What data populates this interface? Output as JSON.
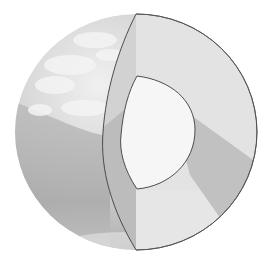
{
  "diagram": {
    "layers": [
      {
        "name": "crust-surface",
        "label": ""
      },
      {
        "name": "mantle",
        "label": ""
      },
      {
        "name": "core",
        "label": ""
      }
    ],
    "colors": {
      "background": "#ffffff",
      "globe_light": "#e4e4e4",
      "globe_dark": "#a9a9a9",
      "cloud": "#f2f2f2",
      "mantle_face": "#e2e2e2",
      "mantle_shadow": "#bdbdbd",
      "core_face": "#f5f5f5",
      "outline": "#3c3c3c"
    }
  }
}
